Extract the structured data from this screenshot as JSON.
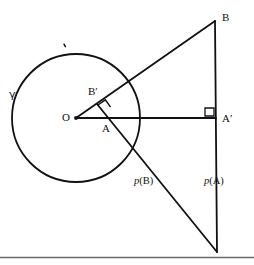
{
  "figure": {
    "type": "geometry-diagram",
    "caption_subject": "Inversion in a circle: polar lines of points A and B",
    "background_color": "#ffffff",
    "stroke_color": "#111111",
    "baseline_rule_color": "#6b6b6b",
    "width": 254,
    "height": 265,
    "circle": {
      "name": "gamma",
      "label": "γ",
      "center_x": 76,
      "center_y": 118,
      "radius": 64,
      "stroke_width": 1.8
    },
    "points": [
      {
        "id": "O",
        "label": "O",
        "x": 76,
        "y": 118,
        "dot": true,
        "label_x": 62,
        "label_y": 112
      },
      {
        "id": "B",
        "label": "B",
        "x": 215,
        "y": 21,
        "dot": false,
        "label_x": 222,
        "label_y": 12
      },
      {
        "id": "Ap",
        "label": "A′",
        "x": 216,
        "y": 118,
        "dot": false,
        "label_x": 222,
        "label_y": 113
      },
      {
        "id": "Bp",
        "label": "B′",
        "x": 98,
        "y": 105,
        "dot": false,
        "label_x": 88,
        "label_y": 86
      },
      {
        "id": "A",
        "label": "A",
        "x": 112,
        "y": 120,
        "dot": false,
        "label_x": 102,
        "label_y": 123
      }
    ],
    "segments": [
      {
        "id": "O-to-B",
        "x1": 76,
        "y1": 118,
        "x2": 215,
        "y2": 21,
        "stroke_width": 1.8
      },
      {
        "id": "O-to-Ap",
        "x1": 76,
        "y1": 118,
        "x2": 216,
        "y2": 118,
        "stroke_width": 1.8
      },
      {
        "id": "B-to-bottom",
        "x1": 215,
        "y1": 21,
        "x2": 217,
        "y2": 252,
        "stroke_width": 1.8
      },
      {
        "id": "Bp-to-bottom",
        "x1": 97,
        "y1": 104,
        "x2": 217,
        "y2": 252,
        "stroke_width": 1.8
      }
    ],
    "right_angle_marks": [
      {
        "id": "right-angle-at-Bp",
        "x": 98,
        "y": 105,
        "size": 9,
        "rotation_deg": -35
      },
      {
        "id": "right-angle-at-Ap",
        "x": 216,
        "y": 118,
        "size": 9,
        "rotation_deg": 180
      }
    ],
    "tick_mark": {
      "id": "circle-top-tick",
      "x": 64,
      "y": 45
    },
    "annotations": [
      {
        "id": "polar-of-B",
        "p": "p",
        "arg": "(B)",
        "label": "p(B)",
        "x": 134,
        "y": 176
      },
      {
        "id": "polar-of-A",
        "p": "p",
        "arg": "(A)",
        "label": "p(A)",
        "x": 204,
        "y": 176
      }
    ],
    "baseline_rule": {
      "id": "page-edge-rule",
      "x1": 0,
      "y1": 257,
      "x2": 254,
      "y2": 257,
      "stroke_width": 1.6
    }
  }
}
